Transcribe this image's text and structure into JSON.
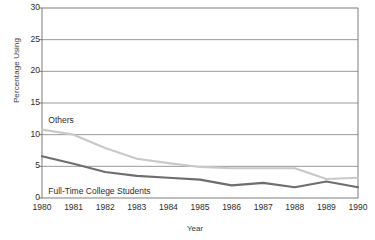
{
  "chart_data": {
    "type": "line",
    "title": "",
    "xlabel": "Year",
    "ylabel": "Percentage Using",
    "x": [
      1980,
      1981,
      1982,
      1983,
      1984,
      1985,
      1986,
      1987,
      1988,
      1989,
      1990
    ],
    "xtick_labels": [
      "1980",
      "1981",
      "1982",
      "1983",
      "1984",
      "1985",
      "1986",
      "1987",
      "1988",
      "1989",
      "1990"
    ],
    "ytick_labels": [
      "0",
      "5",
      "10",
      "15",
      "20",
      "25",
      "30"
    ],
    "yticks": [
      0,
      5,
      10,
      15,
      20,
      25,
      30
    ],
    "ylim": [
      0,
      30
    ],
    "xlim": [
      1980,
      1990
    ],
    "grid": "horizontal",
    "legend": "inline-annotations",
    "series": [
      {
        "name": "Others",
        "color": "#c9c9c9",
        "label_x": 1980.2,
        "label_y": 12.2,
        "values": [
          10.8,
          10.0,
          7.9,
          6.2,
          5.5,
          4.9,
          4.7,
          4.7,
          4.7,
          3.0,
          3.2
        ]
      },
      {
        "name": "Full-Time College Students",
        "color": "#6e6e6e",
        "label_x": 1980.2,
        "label_y": 1.0,
        "values": [
          6.6,
          5.4,
          4.1,
          3.5,
          3.2,
          2.9,
          2.0,
          2.4,
          1.7,
          2.6,
          1.7
        ]
      }
    ]
  },
  "axis": {
    "ylabel": "Percentage Using",
    "xlabel": "Year"
  }
}
